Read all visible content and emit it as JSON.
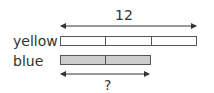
{
  "diagram": {
    "type": "tape-diagram",
    "total_label": "12",
    "unknown_label": "?",
    "bars": [
      {
        "name": "yellow",
        "label": "yellow",
        "segments": 3,
        "fill": "#ffffff"
      },
      {
        "name": "blue",
        "label": "blue",
        "segments": 2,
        "fill": "#cccccc"
      }
    ]
  }
}
